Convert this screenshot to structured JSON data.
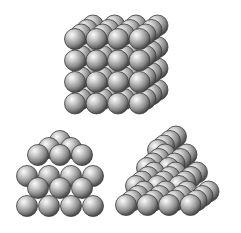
{
  "diagram": {
    "title": "",
    "sphere_style": {
      "highlight": "#f2f2f2",
      "mid": "#a6a6a6",
      "shadow": "#5a5a5a",
      "outline": "#3c3c3c",
      "background": "#ffffff"
    },
    "structures": [
      {
        "id": "simple-cubic-stack",
        "description": "Cubic packing of spheres, 4 x 4 x 4",
        "front_cols": 4,
        "front_rows": 4,
        "depth_layers": 4
      },
      {
        "id": "square-pyramid-stack",
        "description": "Square-based pyramid stack viewed from front",
        "rows_visible": [
          4,
          3,
          4,
          3,
          2,
          1
        ]
      },
      {
        "id": "triangular-pyramid-stack",
        "description": "Triangular/tetrahedral pyramid stack with depth",
        "front_rows": [
          4,
          3,
          2,
          1
        ],
        "depth_layers": 4
      }
    ]
  }
}
